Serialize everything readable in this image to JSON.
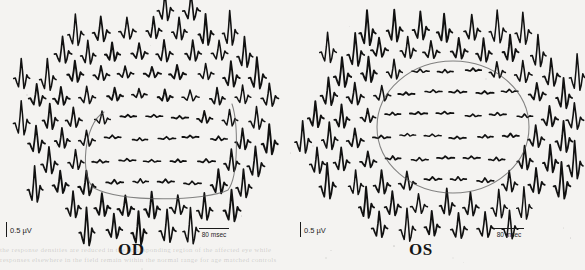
{
  "figure": {
    "type": "multifocal-erg-trace-array",
    "background_color": "#f4f3f1",
    "trace_color": "#111111",
    "annotation_color": "#555555",
    "panel_count": 2
  },
  "panels": [
    {
      "id": "od",
      "eye_label": "OD",
      "amplitude_scale": {
        "value": "0.5 µV",
        "bar_orientation": "vertical"
      },
      "time_scale": {
        "value": "80 msec",
        "bar_orientation": "horizontal"
      },
      "annotation": {
        "name": "reduced-response-outline",
        "shape": "irregular-rounded-region",
        "center_x": 160,
        "center_y": 150,
        "rx": 72,
        "ry": 42
      }
    },
    {
      "id": "os",
      "eye_label": "OS",
      "amplitude_scale": {
        "value": "0.5 µV",
        "bar_orientation": "vertical"
      },
      "time_scale": {
        "value": "80 msec",
        "bar_orientation": "horizontal"
      },
      "annotation": {
        "name": "reduced-response-outline",
        "shape": "ellipse",
        "center_x": 160,
        "center_y": 127,
        "rx": 76,
        "ry": 66
      }
    }
  ],
  "chart_data": {
    "type": "line",
    "xlabel": "80 msec",
    "ylabel": "0.5 µV",
    "legend": [],
    "grid": false,
    "waveform_shape": {
      "description": "N1-P1-N2 multifocal ERG response",
      "normalized_points": [
        [
          0.0,
          0.0
        ],
        [
          0.1,
          0.02
        ],
        [
          0.2,
          -0.22
        ],
        [
          0.3,
          -0.42
        ],
        [
          0.4,
          0.3
        ],
        [
          0.47,
          1.0
        ],
        [
          0.55,
          0.38
        ],
        [
          0.64,
          -0.5
        ],
        [
          0.72,
          -0.3
        ],
        [
          0.82,
          0.18
        ],
        [
          0.9,
          0.05
        ],
        [
          1.0,
          0.0
        ]
      ]
    },
    "series": [
      {
        "name": "OD",
        "hex_rings": [
          1,
          6,
          12,
          18,
          24,
          30
        ],
        "amplitude_by_ring": [
          0.3,
          0.34,
          0.4,
          0.58,
          0.8,
          1.0
        ],
        "suppressed_region": {
          "label": "depressed amplitudes inside outline",
          "amplitude_factor": 0.22,
          "center_x": 160,
          "center_y": 150,
          "rx": 72,
          "ry": 42
        },
        "array_center": [
          150,
          120
        ],
        "array_radius_x": 140,
        "array_radius_y": 118,
        "spacing_x": 26,
        "spacing_y": 22
      },
      {
        "name": "OS",
        "hex_rings": [
          1,
          6,
          12,
          18,
          24,
          30
        ],
        "amplitude_by_ring": [
          0.3,
          0.34,
          0.4,
          0.58,
          0.8,
          1.0
        ],
        "suppressed_region": {
          "label": "depressed amplitudes inside outline",
          "amplitude_factor": 0.22,
          "center_x": 160,
          "center_y": 127,
          "rx": 76,
          "ry": 66
        },
        "array_center": [
          150,
          118
        ],
        "array_radius_x": 140,
        "array_radius_y": 118,
        "spacing_x": 26,
        "spacing_y": 22
      }
    ]
  },
  "page_bleed_through": {
    "line_1": "the response densities are reduced in the corresponding region of the affected eye while",
    "line_2": "responses elsewhere in the field remain within the normal range for age matched controls"
  }
}
